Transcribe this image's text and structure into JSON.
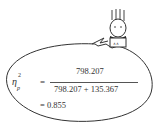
{
  "formula": {
    "lhs_symbol": "η",
    "lhs_superscript": "2",
    "lhs_subscript": "p",
    "equals_1": "=",
    "numerator": "798.207",
    "denominator": "798.207 + 135.367",
    "result_line": "= 0.855"
  },
  "illustration": {
    "character": "stick-figure-with-spiky-hair",
    "bubble": "speech-bubble-ellipse"
  },
  "colors": {
    "stroke": "#333333",
    "text": "#333333",
    "background": "#ffffff"
  }
}
